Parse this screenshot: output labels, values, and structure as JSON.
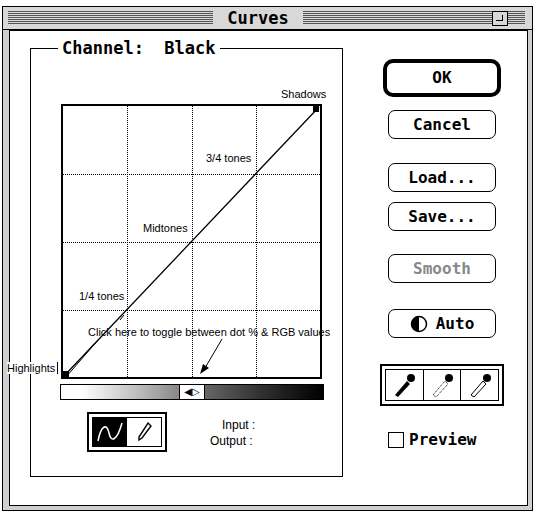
{
  "window": {
    "title": "Curves",
    "zoom_box": "zoom-box-icon"
  },
  "channel": {
    "label": "Channel:",
    "value": "Black",
    "full": "Channel:  Black"
  },
  "graph": {
    "annotations": {
      "shadows": "Shadows",
      "three_quarter": "3/4 tones",
      "midtones": "Midtones",
      "quarter": "1/4 tones",
      "highlights": "Highlights",
      "toggle_hint": "Click here to toggle between dot % & RGB values"
    }
  },
  "tools": {
    "curve_tool": "curve-tool-icon",
    "pencil_tool": "pencil-icon"
  },
  "readout": {
    "input_label": "Input :",
    "output_label": "Output :"
  },
  "buttons": {
    "ok": "OK",
    "cancel": "Cancel",
    "load": "Load...",
    "save": "Save...",
    "smooth": "Smooth",
    "auto": "Auto"
  },
  "eyedroppers": [
    "black-eyedropper-icon",
    "gray-eyedropper-icon",
    "white-eyedropper-icon"
  ],
  "preview": {
    "label": "Preview",
    "checked": false
  }
}
